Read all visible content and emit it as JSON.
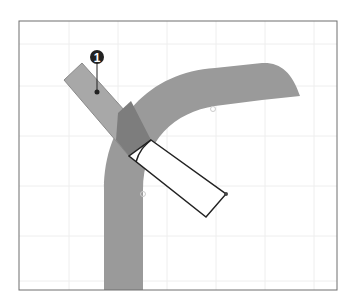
{
  "figure": {
    "callouts": [
      {
        "number": "1",
        "x": 97,
        "y": 57,
        "target_x": 97,
        "target_y": 92
      }
    ],
    "colors": {
      "band": "#9a9a9a",
      "rect_fill": "#a8a8a8",
      "overlap": "#7d7d7d",
      "outline": "#222222",
      "frame": "#6e6e6e",
      "grid": "#eeeeee",
      "callout_bg": "#222222"
    },
    "frame": {
      "x": 19,
      "y": 21,
      "width": 318,
      "height": 269
    },
    "grid": {
      "xs": [
        69,
        118,
        167,
        216,
        265,
        314
      ],
      "ys": [
        44,
        86,
        136,
        186,
        236,
        281
      ]
    }
  }
}
